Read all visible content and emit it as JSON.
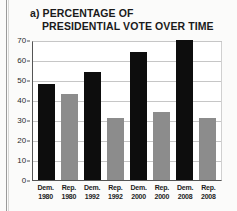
{
  "figure": {
    "label": "a)",
    "title_line_1": "PERCENTAGE OF",
    "title_line_2": "PRESIDENTIAL VOTE OVER TIME"
  },
  "colors": {
    "democrat_bar": "#0d0d0d",
    "republican_bar": "#8c8c8c",
    "gridline": "#c6c6c6",
    "axis": "#555555",
    "plot_background": "#ffffff"
  },
  "chart_data": {
    "type": "bar",
    "title": "a) PERCENTAGE OF PRESIDENTIAL VOTE OVER TIME",
    "xlabel": "",
    "ylabel": "",
    "ylim": [
      0,
      70
    ],
    "yticks": [
      0,
      10,
      20,
      30,
      40,
      50,
      60,
      70
    ],
    "ytick_labels": [
      "0",
      "10",
      "20",
      "30",
      "40",
      "50",
      "60",
      "70"
    ],
    "grid": true,
    "legend": "none",
    "categories": [
      "Dem. 1980",
      "Rep. 1980",
      "Dem. 1992",
      "Rep. 1992",
      "Dem. 2000",
      "Rep. 2000",
      "Dem. 2008",
      "Rep. 2008"
    ],
    "bars": [
      {
        "party": "Dem.",
        "year": "1980",
        "value": 48,
        "color": "#0d0d0d"
      },
      {
        "party": "Rep.",
        "year": "1980",
        "value": 43,
        "color": "#8c8c8c"
      },
      {
        "party": "Dem.",
        "year": "1992",
        "value": 54,
        "color": "#0d0d0d"
      },
      {
        "party": "Rep.",
        "year": "1992",
        "value": 31,
        "color": "#8c8c8c"
      },
      {
        "party": "Dem.",
        "year": "2000",
        "value": 64,
        "color": "#0d0d0d"
      },
      {
        "party": "Rep.",
        "year": "2000",
        "value": 34,
        "color": "#8c8c8c"
      },
      {
        "party": "Dem.",
        "year": "2008",
        "value": 70,
        "color": "#0d0d0d"
      },
      {
        "party": "Rep.",
        "year": "2008",
        "value": 31,
        "color": "#8c8c8c"
      }
    ],
    "values": [
      48,
      43,
      54,
      31,
      64,
      34,
      70,
      31
    ]
  }
}
